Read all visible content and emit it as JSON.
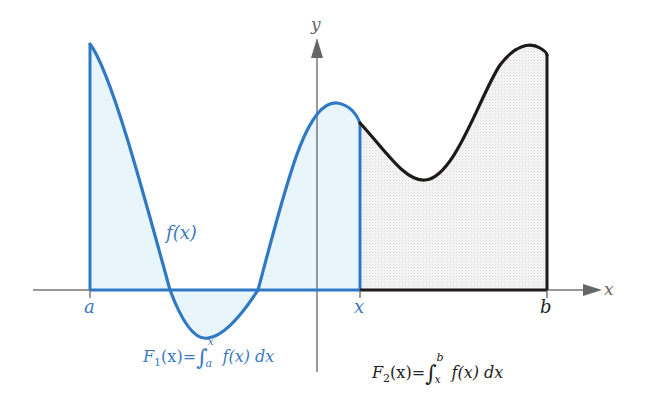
{
  "diagram": {
    "axes": {
      "x_label": "x",
      "y_label": "y"
    },
    "points": {
      "a": "a",
      "x": "x",
      "b": "b"
    },
    "curve_label": "f(x)",
    "formulas": {
      "F1": {
        "name": "F",
        "sub": "1",
        "arg": "(x)",
        "eq": "=",
        "int_lower": "a",
        "int_upper": "x",
        "integrand": "f(x) dx",
        "full": "F1(x) = ∫_a^x f(x) dx"
      },
      "F2": {
        "name": "F",
        "sub": "2",
        "arg": "(x)",
        "eq": "=",
        "int_lower": "x",
        "int_upper": "b",
        "integrand": "f(x) dx",
        "full": "F2(x) = ∫_x^b f(x) dx"
      }
    },
    "colors": {
      "blue_curve": "#2f78c4",
      "blue_fill": "#e8f6fc",
      "black_curve": "#1e1a1a",
      "gray_fill": "#eeeeee",
      "axis": "#777777",
      "blue_text": "#3a79c0"
    }
  }
}
